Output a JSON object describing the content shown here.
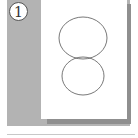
{
  "figure": {
    "step_number": "1",
    "colors": {
      "panel": "#b3b3b3",
      "shadow": "#8f8f8f",
      "paper": "#ffffff",
      "stroke": "#555555"
    },
    "shapes": [
      {
        "type": "ellipse",
        "name": "top-circle",
        "cx": 83,
        "cy": 38,
        "rx": 24,
        "ry": 21
      },
      {
        "type": "ellipse",
        "name": "bottom-circle",
        "cx": 83,
        "cy": 76,
        "rx": 21,
        "ry": 19
      }
    ]
  }
}
